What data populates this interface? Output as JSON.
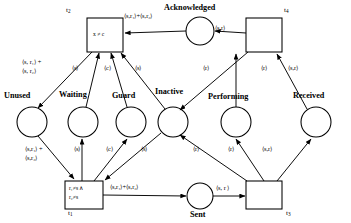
{
  "diagram": {
    "type": "coloured-petri-net",
    "title": "",
    "places": [
      {
        "id": "unused",
        "label": "Unused",
        "cx": 32,
        "cy": 122,
        "r": 15
      },
      {
        "id": "waiting",
        "label": "Waiting",
        "cx": 83,
        "cy": 122,
        "r": 15
      },
      {
        "id": "guard",
        "label": "Guard",
        "cx": 131,
        "cy": 122,
        "r": 15
      },
      {
        "id": "inactive",
        "label": "Inactive",
        "cx": 173,
        "cy": 122,
        "r": 15
      },
      {
        "id": "acknowledged",
        "label": "Acknowledged",
        "cx": 200,
        "cy": 31,
        "r": 14
      },
      {
        "id": "performing",
        "label": "Performing",
        "cx": 236,
        "cy": 122,
        "r": 15
      },
      {
        "id": "received",
        "label": "Received",
        "cx": 316,
        "cy": 122,
        "r": 15
      },
      {
        "id": "sent",
        "label": "Sent",
        "cx": 200,
        "cy": 196,
        "r": 13
      }
    ],
    "transitions": [
      {
        "id": "t2",
        "name": "t",
        "sub": "2",
        "x": 87,
        "y": 18,
        "w": 36,
        "h": 34,
        "inscription": [
          "x ≠ c"
        ],
        "name_pos": "top-left"
      },
      {
        "id": "t4",
        "name": "t",
        "sub": "4",
        "x": 246,
        "y": 18,
        "w": 36,
        "h": 34,
        "inscription": [],
        "name_pos": "top-right"
      },
      {
        "id": "t1",
        "name": "t",
        "sub": "1",
        "x": 65,
        "y": 181,
        "w": 38,
        "h": 28,
        "inscription": [
          "r",
          "≠s ∧",
          "r",
          "≠s"
        ],
        "name_pos": "bottom-left"
      },
      {
        "id": "t3",
        "name": "t",
        "sub": "3",
        "x": 246,
        "y": 181,
        "w": 36,
        "h": 28,
        "inscription": [],
        "name_pos": "bottom-right"
      }
    ],
    "transition_inscriptions": {
      "t2": "x ≠ c",
      "t1_line1": "r₁≠s ∧",
      "t1_line2": "r₂≠s"
    },
    "arc_labels": [
      {
        "id": "a1",
        "text": "⟨s, r₁⟩ +",
        "text2": "⟨s, r₂⟩",
        "x": 22,
        "y": 60
      },
      {
        "id": "a2",
        "text": "⟨s⟩",
        "text2": "",
        "x": 72,
        "y": 66
      },
      {
        "id": "a3",
        "text": "⟨c⟩",
        "text2": "",
        "x": 104,
        "y": 66
      },
      {
        "id": "a4",
        "text": "⟨s⟩",
        "text2": "",
        "x": 135,
        "y": 66
      },
      {
        "id": "a5",
        "text": "⟨s,r₁⟩+⟨s,r₂⟩",
        "text2": "",
        "x": 124,
        "y": 14
      },
      {
        "id": "a6",
        "text": "⟨s,r⟩",
        "text2": "",
        "x": 215,
        "y": 26
      },
      {
        "id": "a7",
        "text": "⟨r⟩",
        "text2": "",
        "x": 203,
        "y": 66
      },
      {
        "id": "a8",
        "text": "⟨r⟩",
        "text2": "",
        "x": 261,
        "y": 66
      },
      {
        "id": "a9",
        "text": "⟨s,r⟩",
        "text2": "",
        "x": 288,
        "y": 66
      },
      {
        "id": "a10",
        "text": "⟨s,r₁⟩ +",
        "text2": "⟨s,r₂⟩",
        "x": 25,
        "y": 150
      },
      {
        "id": "a11",
        "text": "⟨s⟩",
        "text2": "",
        "x": 74,
        "y": 150
      },
      {
        "id": "a12",
        "text": "⟨c⟩",
        "text2": "",
        "x": 106,
        "y": 150
      },
      {
        "id": "a13",
        "text": "⟨s⟩",
        "text2": "",
        "x": 141,
        "y": 150
      },
      {
        "id": "a14",
        "text": "⟨s,r₁⟩+⟨s,r₂⟩",
        "text2": "",
        "x": 110,
        "y": 185
      },
      {
        "id": "a15",
        "text": "⟨r⟩",
        "text2": "",
        "x": 193,
        "y": 150
      },
      {
        "id": "a16",
        "text": "⟨r⟩",
        "text2": "",
        "x": 228,
        "y": 150
      },
      {
        "id": "a17",
        "text": "⟨s,r⟩",
        "text2": "",
        "x": 262,
        "y": 150
      },
      {
        "id": "a18",
        "text": "⟨s, r ⟩",
        "text2": "",
        "x": 216,
        "y": 186
      }
    ],
    "transition_names": [
      {
        "id": "t2name",
        "base": "t",
        "sub": "2",
        "x": 66,
        "y": 7
      },
      {
        "id": "t4name",
        "base": "t",
        "sub": "4",
        "x": 284,
        "y": 7
      },
      {
        "id": "t1name",
        "base": "t",
        "sub": "1",
        "x": 68,
        "y": 211
      },
      {
        "id": "t3name",
        "base": "t",
        "sub": "3",
        "x": 286,
        "y": 211
      }
    ],
    "colors": {
      "stroke": "#000000",
      "background": "#ffffff",
      "text": "#000000"
    }
  }
}
